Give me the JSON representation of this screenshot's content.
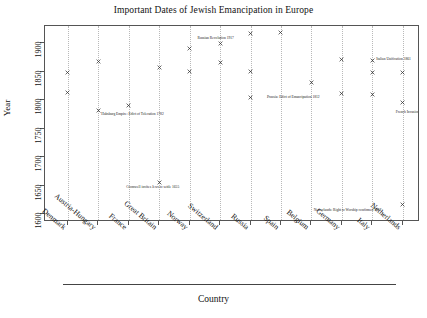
{
  "chart_data": {
    "type": "scatter",
    "title": "Important Dates of Jewish Emancipation in Europe",
    "xlabel": "Country",
    "ylabel": "Year",
    "ylim": [
      1590,
      1930
    ],
    "yticks": [
      1600,
      1650,
      1700,
      1750,
      1800,
      1850,
      1900
    ],
    "ytick_labels": [
      "1600",
      "1650",
      "1700",
      "1750",
      "1800",
      "1850",
      "1900"
    ],
    "grid": "vertical-dotted",
    "legend": "none",
    "marker": "x",
    "categories": [
      "Denmark",
      "Austria-Hungary",
      "France",
      "Great Britain",
      "Norway",
      "Switzerland",
      "Russia",
      "Spain",
      "Belgium",
      "Germany",
      "Italy",
      "Netherlands"
    ],
    "points": [
      {
        "category": "Denmark",
        "year": 1849
      },
      {
        "category": "Denmark",
        "year": 1814
      },
      {
        "category": "Austria-Hungary",
        "year": 1867
      },
      {
        "category": "Austria-Hungary",
        "year": 1782
      },
      {
        "category": "France",
        "year": 1791
      },
      {
        "category": "Great Britain",
        "year": 1858
      },
      {
        "category": "Great Britain",
        "year": 1655
      },
      {
        "category": "Norway",
        "year": 1891
      },
      {
        "category": "Norway",
        "year": 1851
      },
      {
        "category": "Switzerland",
        "year": 1900
      },
      {
        "category": "Switzerland",
        "year": 1866
      },
      {
        "category": "Russia",
        "year": 1917
      },
      {
        "category": "Russia",
        "year": 1850
      },
      {
        "category": "Russia",
        "year": 1804
      },
      {
        "category": "Spain",
        "year": 1918
      },
      {
        "category": "Belgium",
        "year": 1831
      },
      {
        "category": "Germany",
        "year": 1871
      },
      {
        "category": "Germany",
        "year": 1812
      },
      {
        "category": "Italy",
        "year": 1870
      },
      {
        "category": "Italy",
        "year": 1848
      },
      {
        "category": "Italy",
        "year": 1810
      },
      {
        "category": "Netherlands",
        "year": 1848
      },
      {
        "category": "Netherlands",
        "year": 1796
      },
      {
        "category": "Netherlands",
        "year": 1617
      }
    ],
    "annotations": [
      {
        "text": "Habsburg Empire: Edict of Toleration 1782",
        "category": "Austria-Hungary",
        "year": 1782
      },
      {
        "text": "Cromwell invites Jews to settle 1655",
        "category": "Great Britain",
        "year": 1655
      },
      {
        "text": "Russian Revolution 1917",
        "category": "Russia",
        "year": 1917
      },
      {
        "text": "Italian Unification 1861",
        "category": "Italy",
        "year": 1870
      },
      {
        "text": "Prussia: Edict of Emancipation 1812",
        "category": "Germany",
        "year": 1812
      },
      {
        "text": "French Invasion 1798",
        "category": "Netherlands",
        "year": 1796
      },
      {
        "text": "Netherlands: Right to Worship confirmed 1617",
        "category": "Netherlands",
        "year": 1617
      }
    ]
  },
  "colors": {
    "marker": "#333333",
    "frame": "#555555",
    "grid": "#b9b9b9",
    "text": "#111111",
    "background": "#ffffff"
  }
}
